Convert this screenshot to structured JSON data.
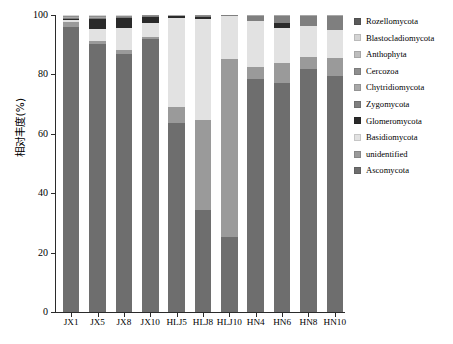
{
  "chart_data": {
    "type": "bar",
    "stacked": true,
    "title": "",
    "xlabel": "",
    "ylabel": "相对丰度(%)",
    "ylim": [
      0,
      100
    ],
    "yticks": [
      0,
      20,
      40,
      60,
      80,
      100
    ],
    "grid": false,
    "legend_position": "right",
    "categories": [
      "JX1",
      "JX5",
      "JX8",
      "JX10",
      "HLJ5",
      "HLJ8",
      "HLJ10",
      "HN4",
      "HN6",
      "HN8",
      "HN10"
    ],
    "series": [
      {
        "name": "Ascomycota",
        "color": "#6e6e6e",
        "values": [
          96.0,
          90.2,
          86.9,
          91.8,
          63.8,
          34.5,
          25.4,
          78.5,
          77.0,
          81.8,
          79.5
        ]
      },
      {
        "name": "unidentified",
        "color": "#9a9a9a",
        "values": [
          1.6,
          1.0,
          1.2,
          0.9,
          5.1,
          30.2,
          59.8,
          3.9,
          6.9,
          4.1,
          6.0
        ]
      },
      {
        "name": "Basidiomycota",
        "color": "#e2e2e2",
        "values": [
          0.6,
          4.0,
          7.6,
          4.7,
          30.2,
          33.9,
          14.6,
          15.7,
          11.8,
          10.3,
          9.6
        ]
      },
      {
        "name": "Glomeromycota",
        "color": "#2a2a2a",
        "values": [
          0.5,
          3.6,
          3.3,
          2.0,
          0.6,
          0.9,
          0.0,
          0.0,
          1.5,
          0.0,
          0.0
        ]
      },
      {
        "name": "Zygomycota",
        "color": "#7f7f7f",
        "values": [
          0.3,
          0.2,
          0.2,
          0.2,
          0.1,
          0.1,
          0.1,
          1.7,
          2.6,
          3.6,
          4.7
        ]
      },
      {
        "name": "Chytridiomycota",
        "color": "#a8a8a8",
        "values": [
          0.4,
          0.4,
          0.3,
          0.2,
          0.1,
          0.2,
          0.1,
          0.1,
          0.1,
          0.1,
          0.1
        ]
      },
      {
        "name": "Cercozoa",
        "color": "#8e8e8e",
        "values": [
          0.2,
          0.2,
          0.2,
          0.1,
          0.05,
          0.1,
          0.0,
          0.05,
          0.05,
          0.05,
          0.05
        ]
      },
      {
        "name": "Anthophyta",
        "color": "#bdbdbd",
        "values": [
          0.2,
          0.2,
          0.1,
          0.05,
          0.05,
          0.05,
          0.0,
          0.0,
          0.05,
          0.05,
          0.05
        ]
      },
      {
        "name": "Blastocladiomycota",
        "color": "#d4d4d4",
        "values": [
          0.1,
          0.1,
          0.1,
          0.03,
          0.0,
          0.03,
          0.0,
          0.03,
          0.0,
          0.0,
          0.0
        ]
      },
      {
        "name": "Rozellomycota",
        "color": "#5a5a5a",
        "values": [
          0.1,
          0.1,
          0.1,
          0.0,
          0.0,
          0.03,
          0.0,
          0.02,
          0.0,
          0.0,
          0.0
        ]
      }
    ]
  },
  "legend": {
    "items": [
      {
        "label": "Rozellomycota",
        "color": "#5a5a5a"
      },
      {
        "label": "Blastocladiomycota",
        "color": "#d4d4d4"
      },
      {
        "label": "Anthophyta",
        "color": "#bdbdbd"
      },
      {
        "label": "Cercozoa",
        "color": "#8e8e8e"
      },
      {
        "label": "Chytridiomycota",
        "color": "#a8a8a8"
      },
      {
        "label": "Zygomycota",
        "color": "#7f7f7f"
      },
      {
        "label": "Glomeromycota",
        "color": "#2a2a2a"
      },
      {
        "label": "Basidiomycota",
        "color": "#e2e2e2"
      },
      {
        "label": "unidentified",
        "color": "#9a9a9a"
      },
      {
        "label": "Ascomycota",
        "color": "#6e6e6e"
      }
    ]
  }
}
